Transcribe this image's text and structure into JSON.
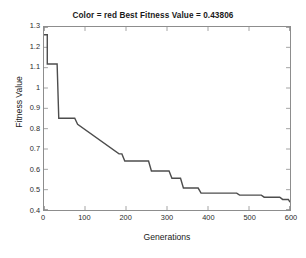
{
  "chart_data": {
    "type": "line",
    "title": "Color = red Best Fitness Value = 0.43806",
    "xlabel": "Generations",
    "ylabel": "Fitness Value",
    "xlim": [
      0,
      600
    ],
    "ylim": [
      0.4,
      1.3
    ],
    "grid": false,
    "legend": false,
    "line_color": "#4d4d4d",
    "step_style": "post",
    "xticks": [
      0,
      100,
      200,
      300,
      400,
      500,
      600
    ],
    "xtick_labels": [
      "0",
      "100",
      "200",
      "300",
      "400",
      "500",
      "600"
    ],
    "yticks": [
      0.4,
      0.5,
      0.6,
      0.7,
      0.8,
      0.9,
      1.0,
      1.1,
      1.2,
      1.3
    ],
    "ytick_labels": [
      "0.4",
      "0.5",
      "0.6",
      "0.7",
      "0.8",
      "0.9",
      "1",
      "1.1",
      "1.2",
      "1.3"
    ],
    "series": [
      {
        "name": "Best fitness",
        "x": [
          0,
          8,
          8,
          32,
          32,
          36,
          36,
          75,
          75,
          82,
          82,
          183,
          183,
          190,
          190,
          197,
          197,
          255,
          255,
          262,
          262,
          305,
          305,
          312,
          312,
          333,
          333,
          340,
          340,
          376,
          376,
          383,
          383,
          470,
          470,
          477,
          477,
          530,
          530,
          537,
          537,
          575,
          575,
          582,
          582,
          596,
          596,
          600
        ],
        "y": [
          1.262,
          1.262,
          1.118,
          1.118,
          1.118,
          0.851,
          0.851,
          0.851,
          0.851,
          0.822,
          0.822,
          0.676,
          0.676,
          0.676,
          0.676,
          0.641,
          0.641,
          0.641,
          0.641,
          0.592,
          0.592,
          0.592,
          0.592,
          0.556,
          0.556,
          0.556,
          0.556,
          0.508,
          0.508,
          0.508,
          0.508,
          0.483,
          0.483,
          0.483,
          0.483,
          0.473,
          0.473,
          0.473,
          0.473,
          0.463,
          0.463,
          0.463,
          0.463,
          0.452,
          0.452,
          0.452,
          0.452,
          0.43806
        ]
      }
    ],
    "best_fitness_value": "0.43806",
    "color_label": "red",
    "plateaus": [
      {
        "generations": [
          0,
          8
        ],
        "value": 1.262
      },
      {
        "generations": [
          8,
          32
        ],
        "value": 1.118
      },
      {
        "generations": [
          36,
          75
        ],
        "value": 0.851
      },
      {
        "generations": [
          75,
          82
        ],
        "value": 0.822
      },
      {
        "generations": [
          82,
          183
        ],
        "value": 0.676
      },
      {
        "generations": [
          190,
          255
        ],
        "value": 0.641
      },
      {
        "generations": [
          262,
          305
        ],
        "value": 0.592
      },
      {
        "generations": [
          312,
          333
        ],
        "value": 0.556
      },
      {
        "generations": [
          340,
          376
        ],
        "value": 0.508
      },
      {
        "generations": [
          383,
          470
        ],
        "value": 0.483
      },
      {
        "generations": [
          477,
          530
        ],
        "value": 0.473
      },
      {
        "generations": [
          537,
          575
        ],
        "value": 0.463
      },
      {
        "generations": [
          582,
          596
        ],
        "value": 0.452
      },
      {
        "generations": [
          596,
          600
        ],
        "value": 0.43806
      }
    ]
  }
}
